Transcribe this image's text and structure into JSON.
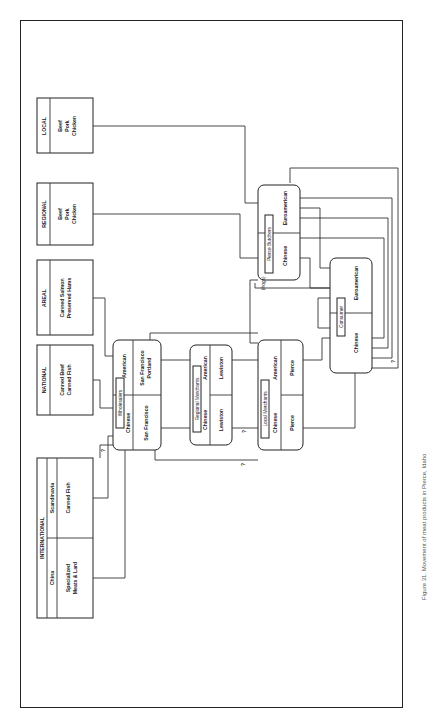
{
  "sources": [
    {
      "title": "INTERNATIONAL",
      "columns": [
        {
          "header": "China",
          "items": [
            "Specialized",
            "Meats & Lard"
          ]
        },
        {
          "header": "Scandinavia",
          "items": [
            "Canned Fish"
          ]
        }
      ]
    },
    {
      "title": "NATIONAL",
      "items": [
        "Canned Beef",
        "Canned Fish"
      ]
    },
    {
      "title": "AREAL",
      "items": [
        "Canned Salmon",
        "Preserved Hams"
      ]
    },
    {
      "title": "REGIONAL",
      "items": [
        "Beef",
        "Pork",
        "Chicken"
      ]
    },
    {
      "title": "LOCAL",
      "items": [
        "Beef",
        "Pork",
        "Chicken"
      ]
    }
  ],
  "nodes": {
    "wholesalers": {
      "label": "Wholesalers",
      "left": {
        "group": "Chinese",
        "place": "San Francisco"
      },
      "right": {
        "group": "American",
        "place": "San Francisco Portland",
        "place_lines": [
          "San Francisco",
          "Portland"
        ]
      }
    },
    "regional": {
      "label": "Regional Merchants",
      "left": {
        "group": "Chinese",
        "place": "Lewiston"
      },
      "right": {
        "group": "American",
        "place": "Lewiston"
      }
    },
    "local": {
      "label": "Local Merchants",
      "left": {
        "group": "Chinese",
        "place": "Pierce"
      },
      "right": {
        "group": "American",
        "place": "Pierce"
      }
    },
    "butchers": {
      "label": "Pierce Butchers",
      "left": {
        "group": "Chinese"
      },
      "right": {
        "group": "Euroamerican"
      }
    },
    "consumer": {
      "label": "Consumer",
      "left": {
        "group": "Chinese"
      },
      "right": {
        "group": "Euroamerican"
      }
    }
  },
  "annotations": {
    "unknown": "?",
    "hogs": "(hogs)"
  },
  "caption": "Figure 31. Movement of meat products in Pierce, Idaho"
}
